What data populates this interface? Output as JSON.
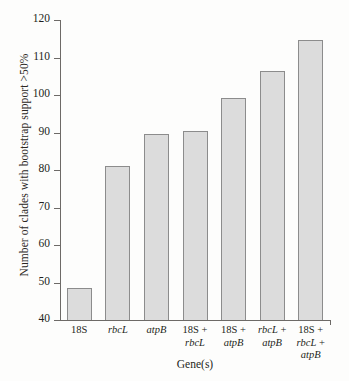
{
  "chart_data": {
    "type": "bar",
    "title": "",
    "xlabel": "Gene(s)",
    "ylabel": "Number of clades with bootstrap support >50%",
    "categories": [
      "18S",
      "rbcL",
      "atpB",
      "18S + rbcL",
      "18S + atpB",
      "rbcL + atpB",
      "18S + rbcL + atpB"
    ],
    "category_parts": [
      [
        {
          "text": "18S",
          "italic": false
        }
      ],
      [
        {
          "text": "rbcL",
          "italic": true
        }
      ],
      [
        {
          "text": "atpB",
          "italic": true
        }
      ],
      [
        {
          "text": "18S + ",
          "italic": false
        },
        {
          "text": "rbcL",
          "italic": true
        }
      ],
      [
        {
          "text": "18S + ",
          "italic": false
        },
        {
          "text": "atpB",
          "italic": true
        }
      ],
      [
        {
          "text": "rbcL",
          "italic": true
        },
        {
          "text": " + ",
          "italic": false
        },
        {
          "text": "atpB",
          "italic": true
        }
      ],
      [
        {
          "text": "18S + ",
          "italic": false
        },
        {
          "text": "rbcL",
          "italic": true
        },
        {
          "text": " + ",
          "italic": false
        },
        {
          "text": "atpB",
          "italic": true
        }
      ]
    ],
    "values": [
      48.5,
      81,
      89.5,
      90.5,
      99.2,
      106.3,
      114.6
    ],
    "ylim": [
      40,
      120
    ],
    "yticks": [
      40,
      50,
      60,
      70,
      80,
      90,
      100,
      110,
      120
    ],
    "grid": false,
    "legend": null,
    "bar_color": "#dcdcdc",
    "bar_edge_color": "#8c8c8c",
    "axis_color": "#6d6a67"
  }
}
